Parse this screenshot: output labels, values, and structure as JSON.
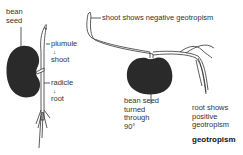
{
  "left_panel": {
    "seed_label_line1": "bean",
    "seed_label_line2": "seed",
    "plumule_label": "plumule",
    "plumule_arrow": "↓",
    "shoot_label": "shoot",
    "radicle_label": "radicle",
    "radicle_arrow": "↓",
    "root_label": "root"
  },
  "right_panel": {
    "shoot_annotation": "shoot shows negative geotropism",
    "seed_label_line1": "bean seed",
    "seed_label_line2": "turned",
    "seed_label_line3": "through",
    "seed_label_line4": "90°",
    "root_label_line1": "root shows",
    "root_label_line2": "positive",
    "root_label_line3": "geotropism",
    "caption": "geotropism"
  },
  "colors": {
    "seed": "#2a2a2a",
    "line": "#333333",
    "stem_fill": "#ffffff",
    "text": "#333333"
  }
}
